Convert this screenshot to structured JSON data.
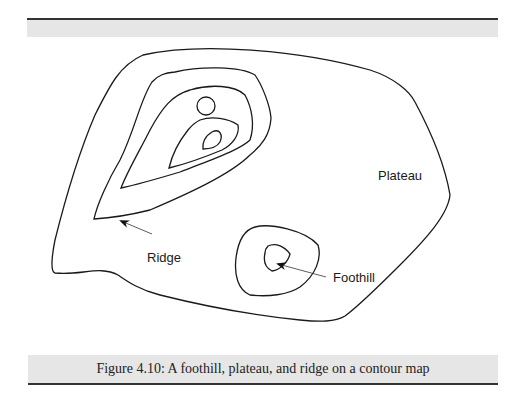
{
  "figure": {
    "type": "contour_map",
    "labels": {
      "plateau": "Plateau",
      "ridge": "Ridge",
      "foothill": "Foothill"
    },
    "caption": "Figure 4.10: A foothill, plateau, and ridge on a contour map"
  }
}
